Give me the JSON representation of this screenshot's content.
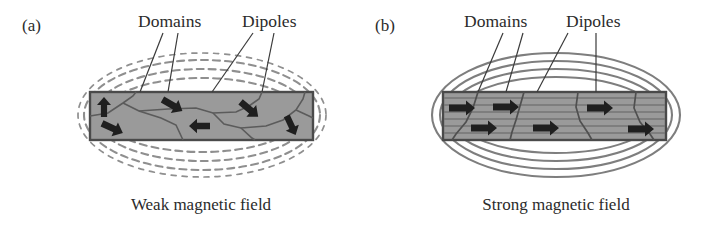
{
  "figure": {
    "type": "diagram",
    "background_color": "#ffffff",
    "ink_color": "#2b2b2b",
    "bar_fill_color": "#9a9a9a",
    "bar_border_color": "#4a4a4a",
    "field_line_color": "#8a8a8a"
  },
  "panels": [
    {
      "id": "a",
      "panel_label": "(a)",
      "caption": "Weak magnetic field",
      "annotations": [
        {
          "label": "Domains",
          "leader_count": 2
        },
        {
          "label": "Dipoles",
          "leader_count": 2
        }
      ],
      "field_lines": {
        "style": "dashed",
        "description": "loosely spaced dashed concentric ellipses, weak field",
        "loop_count": 3
      },
      "bar": {
        "domain_walls": 6,
        "dipole_arrows": [
          {
            "index": 1,
            "direction_deg": -90,
            "note": "points up"
          },
          {
            "index": 2,
            "direction_deg": 25,
            "note": "points down-right"
          },
          {
            "index": 3,
            "direction_deg": 30,
            "note": "points down-right"
          },
          {
            "index": 4,
            "direction_deg": 180,
            "note": "points left"
          },
          {
            "index": 5,
            "direction_deg": 40,
            "note": "points down-right"
          },
          {
            "index": 6,
            "direction_deg": 65,
            "note": "points down-right steeply"
          }
        ],
        "alignment": "random"
      }
    },
    {
      "id": "b",
      "panel_label": "(b)",
      "caption": "Strong magnetic field",
      "annotations": [
        {
          "label": "Domains",
          "leader_count": 2
        },
        {
          "label": "Dipoles",
          "leader_count": 2
        }
      ],
      "field_lines": {
        "style": "solid",
        "description": "tightly packed solid concentric ellipses, strong field",
        "loop_count": 4
      },
      "bar": {
        "texture": "horizontal striations",
        "domain_walls": 4,
        "dipole_arrows": [
          {
            "index": 1,
            "direction_deg": 0,
            "note": "points right"
          },
          {
            "index": 2,
            "direction_deg": 0,
            "note": "points right"
          },
          {
            "index": 3,
            "direction_deg": 0,
            "note": "points right"
          },
          {
            "index": 4,
            "direction_deg": 0,
            "note": "points right"
          },
          {
            "index": 5,
            "direction_deg": 0,
            "note": "points right"
          },
          {
            "index": 6,
            "direction_deg": 0,
            "note": "points right"
          }
        ],
        "alignment": "aligned"
      }
    }
  ]
}
